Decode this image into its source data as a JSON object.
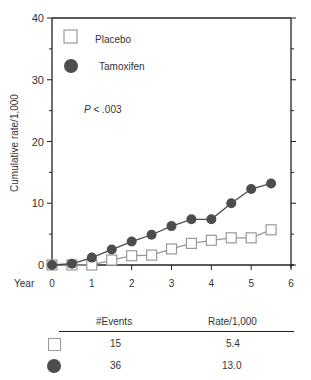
{
  "chart_data": {
    "type": "line",
    "title": "",
    "xlabel": "Year",
    "ylabel": "Cumulative rate/1,000",
    "xlim": [
      0,
      6
    ],
    "ylim": [
      0,
      40
    ],
    "x_ticks": [
      0,
      1,
      2,
      3,
      4,
      5,
      6
    ],
    "y_ticks": [
      0,
      10,
      20,
      30,
      40
    ],
    "grid": false,
    "legend_position": "upper-left-inside",
    "annotation": "P < .003",
    "x": [
      0,
      0.5,
      1,
      1.5,
      2,
      2.5,
      3,
      3.5,
      4,
      4.5,
      5,
      5.5
    ],
    "series": [
      {
        "name": "Placebo",
        "marker": "open-square",
        "color": "#999999",
        "values": [
          0,
          0,
          0,
          0.8,
          1.5,
          1.6,
          2.6,
          3.5,
          4.0,
          4.4,
          4.4,
          5.7
        ]
      },
      {
        "name": "Tamoxifen",
        "marker": "filled-circle",
        "color": "#4d4d4d",
        "values": [
          0,
          0.2,
          1.2,
          2.5,
          3.8,
          4.9,
          6.3,
          7.4,
          7.4,
          10.0,
          12.3,
          13.2
        ]
      }
    ]
  },
  "legend": {
    "placebo_label": "Placebo",
    "tamoxifen_label": "Tamoxifen"
  },
  "annotation": {
    "p_italic": "P",
    "p_rest": " < .003"
  },
  "axis": {
    "ylabel": "Cumulative rate/1,000",
    "xlabel": "Year"
  },
  "summary_table": {
    "headers": [
      "#Events",
      "Rate/1,000"
    ],
    "rows": [
      {
        "group": "Placebo",
        "events": "15",
        "rate": "5.4"
      },
      {
        "group": "Tamoxifen",
        "events": "36",
        "rate": "13.0"
      }
    ]
  }
}
